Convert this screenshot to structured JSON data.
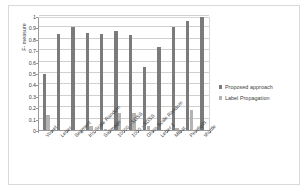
{
  "chart_data": {
    "type": "bar",
    "title": "",
    "xlabel": "",
    "ylabel": "F- measure",
    "ylim": [
      0,
      1
    ],
    "ytick_labels": [
      "0",
      "0.1",
      "0.2",
      "0.3",
      "0.4",
      "0.5",
      "0.6",
      "0.7",
      "0.8",
      "0.9",
      "1"
    ],
    "ytick_values": [
      0,
      0.1,
      0.2,
      0.3,
      0.4,
      0.5,
      0.6,
      0.7,
      0.8,
      0.9,
      1
    ],
    "grid": true,
    "legend_position": "right",
    "categories": [
      "Vowel",
      "Letter",
      "Segment",
      "Iris Scale Random",
      "Satimage",
      "10000 - SDSS",
      "1000 - SDSS",
      "Glass Scale Random",
      "Letter 1",
      "Mfeat",
      "Pendigits",
      "shuttle"
    ],
    "series": [
      {
        "name": "Proposed approach",
        "color": "#7b7b7b",
        "values": [
          0.49,
          0.84,
          0.9,
          0.85,
          0.84,
          0.87,
          0.83,
          0.55,
          0.73,
          0.9,
          0.96,
          0.99
        ]
      },
      {
        "name": "Label Propagation",
        "color": "#b3b3b3",
        "values": [
          0.13,
          0.0,
          0.0,
          0.035,
          0.01,
          0.15,
          0.15,
          0.035,
          0.0,
          0.015,
          0.175,
          0.0
        ]
      }
    ]
  },
  "colors": {
    "series_a": "#7b7b7b",
    "series_b": "#b3b3b3",
    "axis": "#9a9a9a",
    "grid": "#d0d0d0",
    "text": "#3d3d3d",
    "frame": "#d9d9d9",
    "background": "#ffffff"
  }
}
